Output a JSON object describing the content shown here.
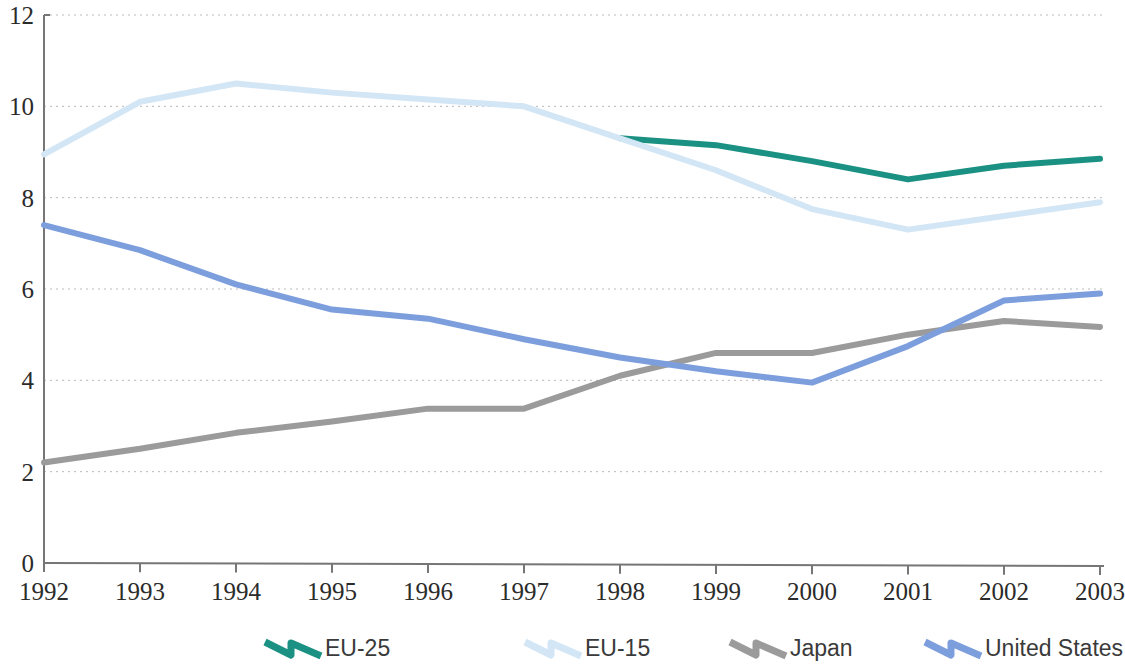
{
  "chart_data": {
    "type": "line",
    "title": "",
    "subtitle": "",
    "xlabel": "",
    "ylabel": "",
    "x": [
      "1992",
      "1993",
      "1994",
      "1995",
      "1996",
      "1997",
      "1998",
      "1999",
      "2000",
      "2001",
      "2002",
      "2003"
    ],
    "categories": [
      "1992",
      "1993",
      "1994",
      "1995",
      "1996",
      "1997",
      "1998",
      "1999",
      "2000",
      "2001",
      "2002",
      "2003"
    ],
    "xlim": [
      1992,
      2003
    ],
    "ylim": [
      0,
      12
    ],
    "y_ticks": [
      "0",
      "2",
      "4",
      "6",
      "8",
      "10",
      "12"
    ],
    "y_tick_values": [
      0,
      2,
      4,
      6,
      8,
      10,
      12
    ],
    "grid": "horizontal-dotted",
    "legend_position": "bottom",
    "series": [
      {
        "name": "EU-25",
        "color": "#1a9183",
        "width": 6,
        "values": [
          null,
          null,
          null,
          null,
          null,
          null,
          9.3,
          9.15,
          8.8,
          8.4,
          8.7,
          8.85
        ]
      },
      {
        "name": "EU-15",
        "color": "#d3e6f6",
        "width": 6,
        "values": [
          8.95,
          10.1,
          10.5,
          10.3,
          10.15,
          10.0,
          9.3,
          8.6,
          7.75,
          7.3,
          7.6,
          7.9
        ]
      },
      {
        "name": "Japan",
        "color": "#9b9b9b",
        "width": 6,
        "values": [
          2.2,
          2.5,
          2.85,
          3.1,
          3.38,
          3.38,
          4.1,
          4.6,
          4.6,
          5.0,
          5.3,
          5.17
        ]
      },
      {
        "name": "United States",
        "color": "#7d9edd",
        "width": 6,
        "values": [
          7.4,
          6.85,
          6.1,
          5.55,
          5.35,
          4.9,
          4.5,
          4.2,
          3.95,
          4.75,
          5.75,
          5.9
        ]
      }
    ]
  },
  "legend": {
    "items": [
      {
        "label": "EU-25",
        "color": "#1a9183",
        "marker": "zigzag-line-marker"
      },
      {
        "label": "EU-15",
        "color": "#d3e6f6",
        "marker": "zigzag-line-marker"
      },
      {
        "label": "Japan",
        "color": "#9b9b9b",
        "marker": "zigzag-line-marker"
      },
      {
        "label": "United States",
        "color": "#7d9edd",
        "marker": "zigzag-line-marker"
      }
    ]
  },
  "axes": {
    "y_labels": [
      "12",
      "10",
      "8",
      "6",
      "4",
      "2",
      "0"
    ],
    "x_labels": [
      "1992",
      "1993",
      "1994",
      "1995",
      "1996",
      "1997",
      "1998",
      "1999",
      "2000",
      "2001",
      "2002",
      "2003"
    ]
  },
  "colors": {
    "axis": "#767676",
    "grid": "#b9b9b9",
    "text": "#2b2b2b",
    "background": "#ffffff"
  }
}
